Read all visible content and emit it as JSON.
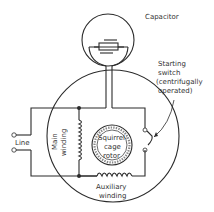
{
  "diagram": {
    "labels": {
      "capacitor": "Capacitor",
      "switch_line1": "Starting",
      "switch_line2": "switch",
      "switch_line3": "(centrifugally",
      "switch_line4": "operated)",
      "line": "Line",
      "main_line1": "Main",
      "main_line2": "winding",
      "rotor_line1": "Squirrel-",
      "rotor_line2": "cage",
      "rotor_line3": "rotor",
      "aux_line1": "Auxiliary",
      "aux_line2": "winding"
    },
    "colors": {
      "line": "#2b2b2b",
      "text": "#333333",
      "background": "#ffffff",
      "rotor_fill": "#e6e6e6"
    }
  }
}
